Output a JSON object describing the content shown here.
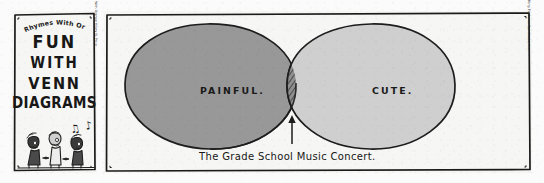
{
  "comic": {
    "feature_name": "Rhymes With Orange",
    "title_lines": [
      "FUN",
      "WITH",
      "VENN",
      "DIAGRAMS"
    ],
    "title_panel": {
      "notes_glyphs": "♫ ♪",
      "credit": "Rhymes With Orange  Hilary B. Price"
    },
    "venn_panel": {
      "left_circle_label": "PAINFUL.",
      "right_circle_label": "CUTE.",
      "caption": "The Grade School Music Concert.",
      "credit": "© 2003 Hilary B. Price / Dist. by King Features Syndicate, Inc."
    },
    "colors": {
      "paper": "#f6f6f4",
      "ink": "#1a1a1a",
      "left_circle_fill": "#989898",
      "right_circle_fill": "#cfcfcf",
      "intersection_fill": "#8a8a8a"
    }
  }
}
